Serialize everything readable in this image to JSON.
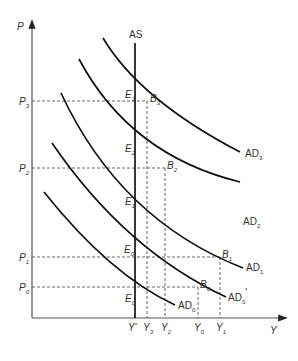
{
  "axes": {
    "y_label": "P",
    "x_label": "Y"
  },
  "curves": {
    "as": "AS",
    "ad3": "AD",
    "ad3_sub": "3",
    "ad2": "AD",
    "ad2_sub": "2",
    "ad1": "AD",
    "ad1_sub": "1",
    "ad0p": "AD",
    "ad0p_sub": "0",
    "ad0p_prime": "′",
    "ad0": "AD",
    "ad0_sub": "0"
  },
  "price_levels": [
    {
      "name": "P",
      "sub": "3"
    },
    {
      "name": "P",
      "sub": "2"
    },
    {
      "name": "P",
      "sub": "1"
    },
    {
      "name": "P",
      "sub": "0"
    }
  ],
  "outputs": [
    {
      "name": "Y",
      "sub": "*"
    },
    {
      "name": "Y",
      "sub": "3"
    },
    {
      "name": "Y",
      "sub": "2"
    },
    {
      "name": "Y",
      "sub": "0"
    },
    {
      "name": "Y",
      "sub": "1"
    }
  ],
  "points": {
    "e3": {
      "name": "E",
      "sub": "3"
    },
    "e2": {
      "name": "E",
      "sub": "2"
    },
    "e1": {
      "name": "E",
      "sub": "1"
    },
    "e0p": {
      "name": "E",
      "sub": "0",
      "prime": "′"
    },
    "e0": {
      "name": "E",
      "sub": "0"
    },
    "b3": {
      "name": "B",
      "sub": "3"
    },
    "b2": {
      "name": "B",
      "sub": "2"
    },
    "b1": {
      "name": "B",
      "sub": "1"
    },
    "b0": {
      "name": "B",
      "sub": "0"
    }
  }
}
